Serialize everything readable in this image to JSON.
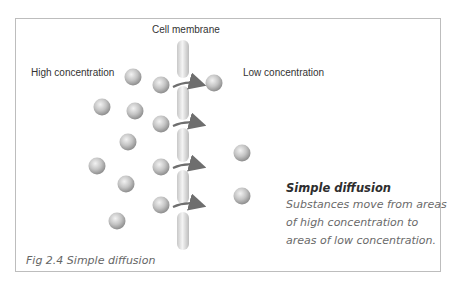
{
  "labels": {
    "membrane": "Cell membrane",
    "high": "High concentration",
    "low": "Low concentration"
  },
  "description": {
    "title": "Simple diffusion",
    "lines": [
      "Substances move from areas",
      "of high concentration to",
      "areas of low concentration."
    ]
  },
  "figure_caption": "Fig 2.4 Simple diffusion",
  "colors": {
    "particle": "#b8b8b8",
    "membrane": "#d6d6d6",
    "arrow": "#707070",
    "frame": "#bdbdbd"
  }
}
